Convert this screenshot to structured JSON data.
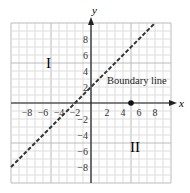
{
  "chart_data": {
    "type": "line",
    "title": "",
    "xlabel": "x",
    "ylabel": "y",
    "xlim": [
      -10,
      10
    ],
    "ylim": [
      -10,
      10
    ],
    "grid": true,
    "x_ticks": [
      "-8",
      "-6",
      "-4",
      "-2",
      "2",
      "4",
      "6",
      "8"
    ],
    "y_ticks": [
      "8",
      "6",
      "4",
      "2",
      "-2",
      "-4",
      "-6",
      "-8"
    ],
    "series": [
      {
        "name": "Boundary line",
        "style": "dashed",
        "equation": "y = x + 2",
        "x": [
          -10,
          8
        ],
        "y": [
          -8,
          10
        ]
      }
    ],
    "points": [
      {
        "x": 5,
        "y": 0
      }
    ],
    "annotations": [
      {
        "text": "Boundary line",
        "x": 6,
        "y": 3
      },
      {
        "text": "I",
        "x": -7,
        "y": 4
      },
      {
        "text": "II",
        "x": 6,
        "y": -5
      }
    ]
  },
  "labels": {
    "x_axis": "x",
    "y_axis": "y",
    "boundary": "Boundary line",
    "region1": "I",
    "region2": "II"
  }
}
